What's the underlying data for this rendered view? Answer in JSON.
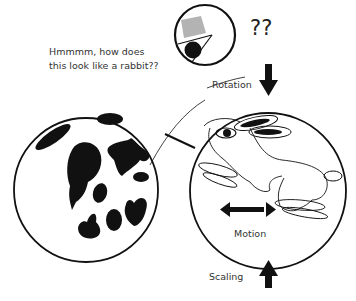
{
  "caption": {
    "line1": "Hmmmm, how does",
    "line2": "this look like a rabbit??"
  },
  "question_marks": "??",
  "labels": {
    "rotation": "Rotation",
    "motion": "Motion",
    "scaling": "Scaling"
  },
  "colors": {
    "ink": "#111111",
    "gray_patch": "#b0b0b0",
    "background": "#ffffff"
  }
}
